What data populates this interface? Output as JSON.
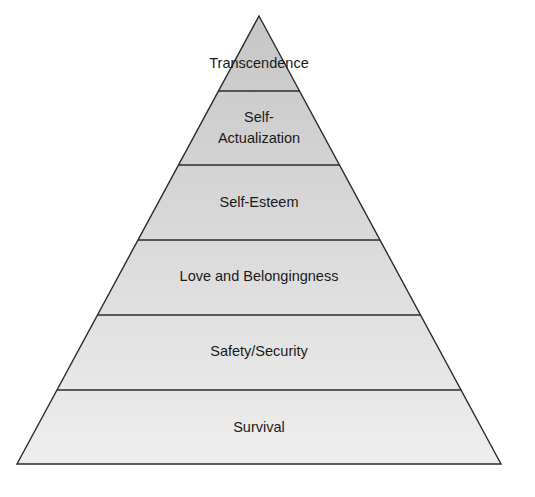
{
  "diagram": {
    "type": "pyramid",
    "colors": {
      "stroke": "#2a2a2a",
      "fill_top": "#c6c6c6",
      "fill_bottom": "#eeeeee",
      "background": "#ffffff",
      "text": "#1a1a1a"
    },
    "tiers": [
      {
        "label": "Transcendence",
        "lines": [
          "Transcendence"
        ]
      },
      {
        "label": "Self-Actualization",
        "lines": [
          "Self-",
          "Actualization"
        ]
      },
      {
        "label": "Self-Esteem",
        "lines": [
          "Self-Esteem"
        ]
      },
      {
        "label": "Love and Belongingness",
        "lines": [
          "Love and Belongingness"
        ]
      },
      {
        "label": "Safety/Security",
        "lines": [
          "Safety/Security"
        ]
      },
      {
        "label": "Survival",
        "lines": [
          "Survival"
        ]
      }
    ]
  }
}
